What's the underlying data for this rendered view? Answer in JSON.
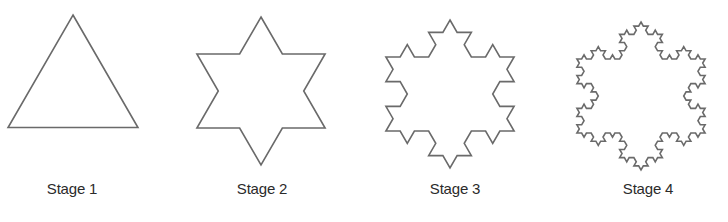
{
  "figure": {
    "stroke_color": "#6a6a6a",
    "label_color": "#2b2b2b",
    "stages": [
      {
        "label": "Stage 1",
        "iterations": 0,
        "center_x": 73,
        "center_y": 90,
        "radius": 75,
        "label_x": 72
      },
      {
        "label": "Stage 2",
        "iterations": 1,
        "center_x": 261,
        "center_y": 91,
        "radius": 74,
        "label_x": 262
      },
      {
        "label": "Stage 3",
        "iterations": 2,
        "center_x": 450,
        "center_y": 94,
        "radius": 74,
        "label_x": 455
      },
      {
        "label": "Stage 4",
        "iterations": 3,
        "center_x": 641,
        "center_y": 96,
        "radius": 74,
        "label_x": 648
      }
    ]
  }
}
